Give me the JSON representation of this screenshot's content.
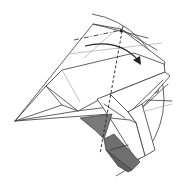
{
  "diagram": {
    "type": "origami-fold-diagram",
    "colors": {
      "line": "#3a3a3a",
      "light_crease": "#a8a8a8",
      "paper_white": "#ffffff",
      "paper_colored": "#7a7a7a",
      "paper_colored_dark": "#5e5e5e"
    },
    "elements": {
      "view_boundary": {
        "shape": "circular-arc",
        "label": ""
      },
      "mountain_fold_line": {
        "style": "dash-dot",
        "label": ""
      },
      "valley_fold_line": {
        "style": "dashed",
        "label": ""
      },
      "fold_arrow": {
        "direction": "clockwise",
        "label": ""
      },
      "colored_side": {
        "label": ""
      }
    },
    "text_labels": []
  }
}
